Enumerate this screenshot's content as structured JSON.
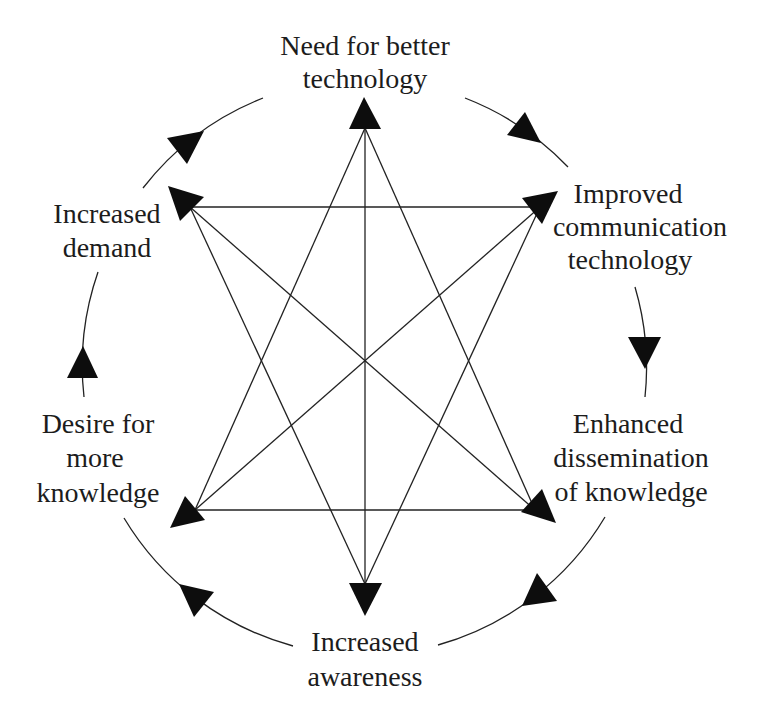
{
  "diagram": {
    "title": "",
    "cycle_direction": "clockwise",
    "nodes": [
      {
        "id": "need",
        "position": "top",
        "lines": [
          "Need for better",
          "technology"
        ]
      },
      {
        "id": "improved",
        "position": "top-right",
        "lines": [
          "Improved",
          "communication",
          "technology"
        ]
      },
      {
        "id": "enhanced",
        "position": "bottom-right",
        "lines": [
          "Enhanced",
          "dissemination",
          "of knowledge"
        ]
      },
      {
        "id": "awareness",
        "position": "bottom",
        "lines": [
          "Increased",
          "awareness"
        ]
      },
      {
        "id": "desire",
        "position": "bottom-left",
        "lines": [
          "Desire for",
          "more",
          "knowledge"
        ]
      },
      {
        "id": "demand",
        "position": "top-left",
        "lines": [
          "Increased",
          "demand"
        ]
      }
    ],
    "cycle_edges": [
      [
        "need",
        "improved"
      ],
      [
        "improved",
        "enhanced"
      ],
      [
        "enhanced",
        "awareness"
      ],
      [
        "awareness",
        "desire"
      ],
      [
        "desire",
        "demand"
      ],
      [
        "demand",
        "need"
      ]
    ],
    "cross_links": [
      [
        "need",
        "awareness"
      ],
      [
        "demand",
        "improved"
      ],
      [
        "desire",
        "enhanced"
      ],
      [
        "demand",
        "enhanced"
      ],
      [
        "improved",
        "desire"
      ],
      [
        "need",
        "desire"
      ],
      [
        "need",
        "enhanced"
      ],
      [
        "awareness",
        "demand"
      ],
      [
        "awareness",
        "improved"
      ]
    ],
    "cross_link_style": "bidirectional arrows",
    "colors": {
      "background": "#ffffff",
      "line": "#222222",
      "arrowhead": "#0d0d0d",
      "text": "#1c1c1c"
    }
  }
}
